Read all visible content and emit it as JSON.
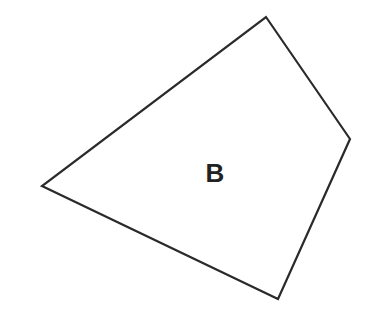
{
  "diagram": {
    "shape": "quadrilateral",
    "label": "B",
    "vertices": [
      {
        "x": 266,
        "y": 17
      },
      {
        "x": 350,
        "y": 139
      },
      {
        "x": 278,
        "y": 299
      },
      {
        "x": 42,
        "y": 186
      }
    ],
    "stroke_color": "#2a2a2a",
    "fill_color": "#ffffff",
    "label_color": "#222222",
    "label_position": {
      "x": 215,
      "y": 182
    }
  }
}
